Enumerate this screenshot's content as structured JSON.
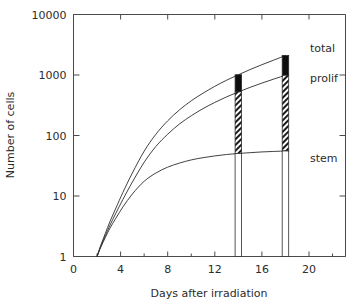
{
  "chart_data": {
    "type": "line",
    "title": "",
    "xlabel": "Days after irradiation",
    "ylabel": "Number of cells",
    "yscale": "log",
    "xscale": "linear",
    "xlim": [
      0,
      23.1
    ],
    "ylim": [
      1,
      10000
    ],
    "grid": false,
    "legend_position": "right-inline",
    "x_ticks": [
      0,
      4,
      8,
      12,
      16,
      20
    ],
    "x_tick_labels": [
      "0",
      "4",
      "8",
      "12",
      "16",
      "20"
    ],
    "x_minor_ticks": [
      2,
      6,
      10,
      14,
      18,
      22
    ],
    "y_ticks": [
      1,
      10,
      100,
      1000,
      10000
    ],
    "y_tick_labels": [
      "1",
      "10",
      "100",
      "1000",
      "10000"
    ],
    "series": [
      {
        "name": "total",
        "label": "total",
        "x": [
          2.0,
          2.3,
          2.7,
          3.1,
          3.6,
          4.2,
          5.0,
          6.0,
          7.0,
          8.0,
          9.0,
          10.0,
          11.0,
          12.0,
          13.0,
          14.0,
          15.0,
          16.0,
          17.0,
          18.0
        ],
        "y": [
          1.0,
          1.5,
          2.4,
          3.8,
          6.3,
          11.5,
          24.0,
          55.0,
          105.0,
          175.0,
          265.0,
          375.0,
          500.0,
          650.0,
          820.0,
          1010.0,
          1230.0,
          1480.0,
          1760.0,
          2100.0
        ]
      },
      {
        "name": "prolif",
        "label": "prolif",
        "x": [
          2.0,
          2.3,
          2.7,
          3.1,
          3.6,
          4.2,
          5.0,
          6.0,
          7.0,
          8.0,
          9.0,
          10.0,
          11.0,
          12.0,
          13.0,
          14.0,
          15.0,
          16.0,
          17.0,
          18.0
        ],
        "y": [
          1.0,
          1.45,
          2.2,
          3.3,
          5.2,
          8.8,
          17.0,
          36.0,
          66.0,
          105.0,
          155.0,
          212.0,
          278.0,
          352.0,
          435.0,
          525.0,
          625.0,
          735.0,
          855.0,
          990.0
        ]
      },
      {
        "name": "stem",
        "label": "stem",
        "x": [
          2.0,
          2.3,
          2.7,
          3.1,
          3.6,
          4.2,
          5.0,
          6.0,
          7.0,
          8.0,
          9.0,
          10.0,
          11.0,
          12.0,
          13.0,
          14.0,
          15.0,
          16.0,
          17.0,
          18.0
        ],
        "y": [
          1.0,
          1.4,
          2.05,
          2.95,
          4.3,
          6.6,
          10.8,
          17.5,
          24.0,
          30.0,
          35.0,
          39.5,
          43.0,
          46.0,
          48.5,
          50.5,
          52.0,
          53.5,
          54.5,
          55.5
        ]
      }
    ],
    "bars": [
      {
        "name": "bar-day-14",
        "x": 14,
        "segments": [
          {
            "name": "nonprolif-fraction",
            "style": "black",
            "from": 525,
            "to": 1010
          },
          {
            "name": "prolif-fraction",
            "style": "hatched",
            "from": 50.5,
            "to": 525
          },
          {
            "name": "stem-fraction",
            "style": "open",
            "from": 1,
            "to": 50.5
          }
        ]
      },
      {
        "name": "bar-day-18",
        "x": 18,
        "segments": [
          {
            "name": "nonprolif-fraction",
            "style": "black",
            "from": 990,
            "to": 2100
          },
          {
            "name": "prolif-fraction",
            "style": "hatched",
            "from": 55.5,
            "to": 990
          },
          {
            "name": "stem-fraction",
            "style": "open",
            "from": 1,
            "to": 55.5
          }
        ]
      }
    ],
    "annotations": [
      {
        "name": "label-total",
        "text": "total",
        "x_px": 310,
        "y_px": 52
      },
      {
        "name": "label-prolif",
        "text": "prolif",
        "x_px": 310,
        "y_px": 82
      },
      {
        "name": "label-stem",
        "text": "stem",
        "x_px": 310,
        "y_px": 162
      }
    ]
  },
  "axes": {
    "y_title": "Number of cells",
    "x_title": "Days after irradiation",
    "y_labels": [
      "10000",
      "1000",
      "100",
      "10",
      "1"
    ],
    "x_labels": [
      "0",
      "4",
      "8",
      "12",
      "16",
      "20"
    ]
  },
  "labels": {
    "total": "total",
    "prolif": "prolif",
    "stem": "stem"
  },
  "colors": {
    "axis": "#4a4a4a",
    "curve": "#2b2b2b",
    "text": "#2b2b2b",
    "bar_fill_solid": "#0d0d0d",
    "bar_fill_open": "#ffffff",
    "background": "#ffffff"
  }
}
